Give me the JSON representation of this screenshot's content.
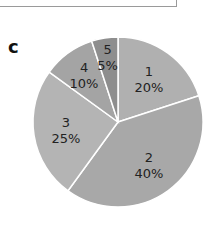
{
  "panel_label": "c",
  "chart_data": {
    "type": "pie",
    "title": "",
    "categories": [
      "1",
      "2",
      "3",
      "4",
      "5"
    ],
    "values": [
      20,
      40,
      25,
      10,
      5
    ],
    "labels": [
      "20%",
      "40%",
      "25%",
      "10%",
      "5%"
    ],
    "colors": [
      "#b0b0b0",
      "#a8a8a8",
      "#b4b4b4",
      "#a4a4a4",
      "#8e8e8e"
    ],
    "start_angle_deg": 0,
    "direction": "clockwise",
    "legend": "none"
  }
}
